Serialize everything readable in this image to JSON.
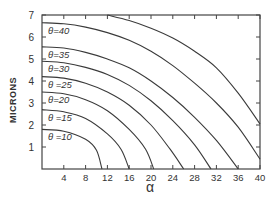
{
  "chart_data": {
    "type": "line",
    "title": "",
    "xlabel": "α",
    "ylabel": "MICRONS",
    "xlim": [
      0,
      40
    ],
    "ylim": [
      0,
      7
    ],
    "grid": false,
    "legend_position": "inline labels near left axis",
    "x_ticks": [
      4,
      8,
      12,
      16,
      20,
      24,
      28,
      32,
      36,
      40
    ],
    "y_ticks": [
      1,
      2,
      3,
      4,
      5,
      6,
      7
    ],
    "series": [
      {
        "name": "θ=10",
        "label": "θ =10",
        "points": [
          [
            0,
            1.8
          ],
          [
            4,
            1.72
          ],
          [
            8,
            1.35
          ],
          [
            10,
            0.85
          ],
          [
            11,
            0
          ]
        ]
      },
      {
        "name": "θ=15",
        "label": "θ =15",
        "points": [
          [
            0,
            2.7
          ],
          [
            4,
            2.6
          ],
          [
            8,
            2.3
          ],
          [
            12,
            1.6
          ],
          [
            14.5,
            0.9
          ],
          [
            16,
            0
          ]
        ]
      },
      {
        "name": "θ=20",
        "label": "θ=20",
        "points": [
          [
            0,
            3.5
          ],
          [
            4,
            3.42
          ],
          [
            8,
            3.15
          ],
          [
            12,
            2.65
          ],
          [
            16,
            1.8
          ],
          [
            19,
            0.9
          ],
          [
            20.5,
            0
          ]
        ]
      },
      {
        "name": "θ=25",
        "label": "θ =25",
        "points": [
          [
            0,
            4.2
          ],
          [
            4,
            4.13
          ],
          [
            8,
            3.9
          ],
          [
            12,
            3.5
          ],
          [
            16,
            2.9
          ],
          [
            20,
            2.0
          ],
          [
            23.5,
            0.9
          ],
          [
            26,
            0
          ]
        ]
      },
      {
        "name": "θ=30",
        "label": "θ=30",
        "points": [
          [
            0,
            4.9
          ],
          [
            4,
            4.83
          ],
          [
            8,
            4.62
          ],
          [
            12,
            4.3
          ],
          [
            16,
            3.8
          ],
          [
            20,
            3.1
          ],
          [
            24,
            2.2
          ],
          [
            28,
            1.1
          ],
          [
            31,
            0
          ]
        ]
      },
      {
        "name": "θ=35",
        "label": "θ=35",
        "points": [
          [
            0,
            5.55
          ],
          [
            4,
            5.5
          ],
          [
            8,
            5.3
          ],
          [
            12,
            5.0
          ],
          [
            16,
            4.6
          ],
          [
            20,
            4.0
          ],
          [
            24,
            3.25
          ],
          [
            28,
            2.35
          ],
          [
            32,
            1.3
          ],
          [
            36,
            0
          ]
        ]
      },
      {
        "name": "θ=40",
        "label": "θ=40",
        "points": [
          [
            0,
            6.65
          ],
          [
            4,
            6.6
          ],
          [
            8,
            6.45
          ],
          [
            12,
            6.2
          ],
          [
            16,
            5.85
          ],
          [
            20,
            5.35
          ],
          [
            24,
            4.7
          ],
          [
            28,
            3.9
          ],
          [
            32,
            3.0
          ],
          [
            36,
            1.9
          ],
          [
            40,
            0.45
          ]
        ]
      },
      {
        "name": "θ>40 (unlabeled)",
        "label": "",
        "points": [
          [
            12,
            7.0
          ],
          [
            16,
            6.75
          ],
          [
            20,
            6.4
          ],
          [
            24,
            5.95
          ],
          [
            28,
            5.35
          ],
          [
            32,
            4.6
          ],
          [
            36,
            3.45
          ],
          [
            40,
            2.05
          ]
        ]
      }
    ]
  }
}
